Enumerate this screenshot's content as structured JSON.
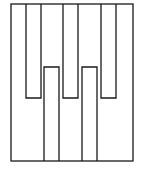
{
  "diagram": {
    "title": "",
    "stroke_color": "#1a1a1a",
    "background": "#ffffff",
    "outer_frame": {
      "x": 11,
      "y": 4,
      "width": 122,
      "height": 157
    },
    "hanging_bars": [
      {
        "x": 26,
        "width": 15,
        "top": 4,
        "bottom": 98
      },
      {
        "x": 63,
        "width": 15,
        "top": 4,
        "bottom": 98
      },
      {
        "x": 101,
        "width": 15,
        "top": 4,
        "bottom": 98
      }
    ],
    "rising_bars": [
      {
        "x": 44,
        "width": 15,
        "top": 67,
        "bottom": 161
      },
      {
        "x": 82,
        "width": 15,
        "top": 67,
        "bottom": 161
      }
    ]
  }
}
